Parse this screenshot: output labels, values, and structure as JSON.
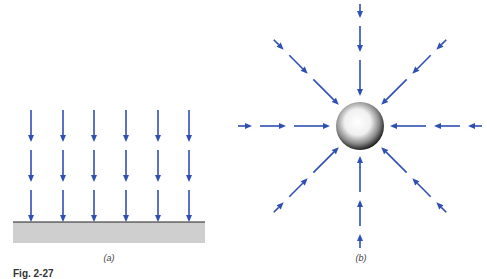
{
  "figure": {
    "caption": "Fig. 2-27",
    "arrow_color": "#2f4fb5",
    "panels": [
      {
        "label": "(a)",
        "description": "Uniform parallel field lines pointing down onto a flat surface",
        "columns_x": [
          31,
          63,
          94,
          126,
          158,
          189
        ],
        "rows_y": [
          [
            110,
            142
          ],
          [
            150,
            182
          ],
          [
            190,
            222
          ]
        ],
        "surface": {
          "x": 13,
          "y": 222,
          "width": 192,
          "height": 21,
          "fill": "#cfcfcf",
          "edge": "#222222"
        }
      },
      {
        "label": "(b)",
        "description": "Radial field lines converging on a sphere",
        "sphere": {
          "cx": 360,
          "cy": 126,
          "r": 24
        },
        "directions_deg": [
          0,
          45,
          90,
          135,
          180,
          225,
          270,
          315
        ],
        "segments": [
          [
            30,
            66
          ],
          [
            74,
            100
          ],
          [
            108,
            122
          ]
        ]
      }
    ]
  }
}
